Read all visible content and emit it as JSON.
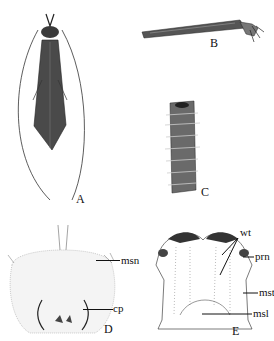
{
  "figure": {
    "panels": [
      {
        "id": "A",
        "label": "A",
        "description": "adult insect dorsal view with long antennae"
      },
      {
        "id": "B",
        "label": "B",
        "description": "larval case lateral view with larva head and legs protruding"
      },
      {
        "id": "C",
        "label": "C",
        "description": "larval case of stick fragments"
      },
      {
        "id": "D",
        "label": "D",
        "description": "mesonotum dorsal view",
        "annotations": [
          "msn",
          "cp"
        ]
      },
      {
        "id": "E",
        "label": "E",
        "description": "thoracic sclerites dorsal view",
        "annotations": [
          "wt",
          "prn",
          "mst",
          "msl"
        ]
      }
    ],
    "annotations": {
      "msn": "msn",
      "cp": "cp",
      "wt": "wt",
      "prn": "prn",
      "mst": "mst",
      "msl": "msl"
    }
  }
}
